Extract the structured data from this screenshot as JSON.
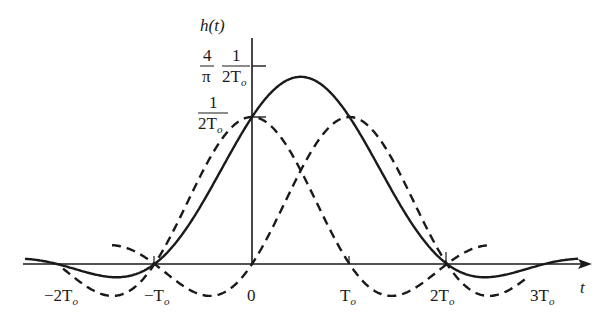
{
  "figure": {
    "y_label": "h(t)",
    "x_label": "t",
    "y_ticks": [
      {
        "name": "peak",
        "numerator_left": "4",
        "denominator_left": "π",
        "numerator_right": "1",
        "denominator_right": "2T",
        "denominator_right_sub": "o"
      },
      {
        "name": "half",
        "numerator": "1",
        "denominator": "2T",
        "denominator_sub": "o"
      }
    ],
    "x_ticks": [
      {
        "label": "−2T",
        "sub": "o",
        "t": -2
      },
      {
        "label": "−T",
        "sub": "o",
        "t": -1
      },
      {
        "label": "0",
        "sub": "",
        "t": 0
      },
      {
        "label": "T",
        "sub": "o",
        "t": 1
      },
      {
        "label": "2T",
        "sub": "o",
        "t": 2
      },
      {
        "label": "3T",
        "sub": "o",
        "t": 3
      }
    ],
    "curves": [
      {
        "name": "sum-pulse",
        "style": "solid",
        "description": "h(t) = sinc(t/To) + sinc((t−To)/To)"
      },
      {
        "name": "pulse-at-0",
        "style": "dashed",
        "description": "sinc(t/To)"
      },
      {
        "name": "pulse-at-To",
        "style": "dashed",
        "description": "sinc((t−To)/To)"
      }
    ],
    "colors": {
      "ink": "#1a1a1a",
      "background": "#ffffff"
    }
  }
}
